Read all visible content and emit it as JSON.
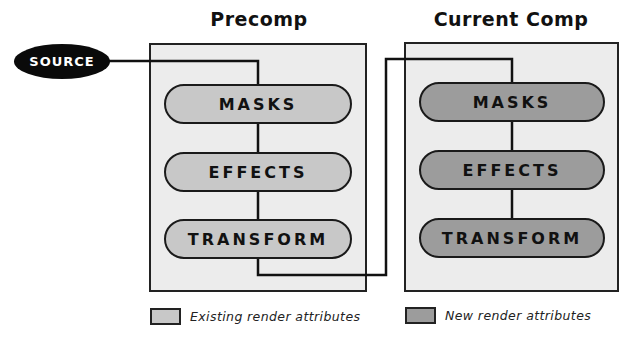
{
  "colors": {
    "box_fill": "#ececec",
    "existing_fill": "#c8c8c8",
    "new_fill": "#9c9c9c",
    "source_fill": "#0a0a0a",
    "line": "#111111"
  },
  "source": {
    "label": "SOURCE"
  },
  "precomp": {
    "title": "Precomp",
    "stages": [
      {
        "label": "MASKS"
      },
      {
        "label": "EFFECTS"
      },
      {
        "label": "TRANSFORM"
      }
    ]
  },
  "current_comp": {
    "title": "Current Comp",
    "stages": [
      {
        "label": "MASKS"
      },
      {
        "label": "EFFECTS"
      },
      {
        "label": "TRANSFORM"
      }
    ]
  },
  "legend": {
    "existing": {
      "label": "Existing render attributes"
    },
    "new": {
      "label": "New render attributes"
    }
  }
}
